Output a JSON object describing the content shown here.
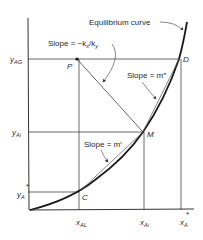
{
  "diagram": {
    "type": "equilibrium-curve-mass-transfer",
    "curve_label": "Equilibrium curve",
    "slope_labels": {
      "driving_force": "Slope = −k",
      "driving_force_sub_x": "x",
      "driving_force_slash": "/k",
      "driving_force_sub_y": "y",
      "m_double_prime": "Slope = m″",
      "m_prime": "Slope = m′"
    },
    "points": {
      "P": "P",
      "D": "D",
      "M": "M",
      "C": "C"
    },
    "y_axis_labels": {
      "y_AG": {
        "main": "y",
        "sub": "AG"
      },
      "y_Ai": {
        "main": "y",
        "sub": "Ai"
      },
      "y_A_star": {
        "main": "y",
        "sub": "A",
        "sup": "*"
      }
    },
    "x_axis_labels": {
      "x_AL": {
        "main": "x",
        "sub": "AL"
      },
      "x_Ai": {
        "main": "x",
        "sub": "Ai"
      },
      "x_A_star": {
        "main": "x",
        "sub": "A",
        "sup": "*"
      }
    }
  }
}
